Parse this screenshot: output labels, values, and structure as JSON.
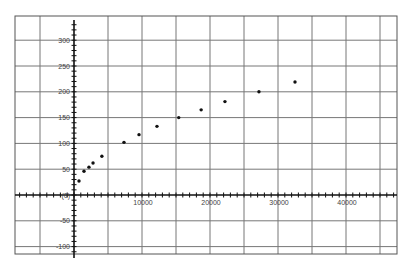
{
  "chart_data": {
    "type": "scatter",
    "title": "",
    "xlabel": "",
    "ylabel": "",
    "xlim": [
      -8500,
      47000
    ],
    "ylim": [
      -115,
      345
    ],
    "grid": true,
    "legend": null,
    "x_major_ticks": [
      10000,
      20000,
      30000,
      40000
    ],
    "x_tick_labels": [
      "10000",
      "20000",
      "30000",
      "40000"
    ],
    "x_grid_step": 5000,
    "x_minor_step": 1000,
    "y_major_ticks": [
      300,
      250,
      200,
      150,
      100,
      50,
      0,
      -50,
      -100
    ],
    "y_tick_labels": [
      "300",
      "250",
      "200",
      "150",
      "100",
      "50",
      "(0)",
      "-50",
      "-100"
    ],
    "y_grid_step": 50,
    "y_minor_step": 10,
    "series": [
      {
        "name": "data",
        "x": [
          735,
          1470,
          2200,
          2800,
          4100,
          7350,
          9560,
          12200,
          15400,
          18700,
          22200,
          27200,
          32500
        ],
        "y": [
          27,
          46,
          54,
          62,
          75,
          102,
          117,
          133,
          150,
          165,
          181,
          200,
          219
        ]
      }
    ]
  },
  "colors": {
    "frame": "#555555",
    "grid": "#777777",
    "axis": "#111111",
    "point": "#111111",
    "label": "#444444",
    "background": "#ffffff"
  }
}
